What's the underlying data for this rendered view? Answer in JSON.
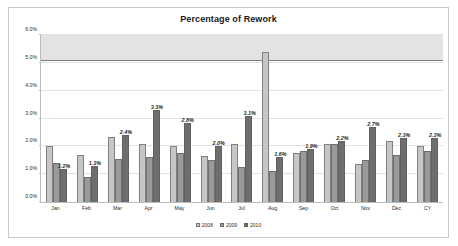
{
  "chart_data": {
    "type": "bar",
    "title": "Percentage of Rework",
    "xlabel": "",
    "ylabel": "",
    "ylim": [
      0,
      6
    ],
    "ytick_labels": [
      "0.0%",
      "1.0%",
      "2.0%",
      "3.0%",
      "4.0%",
      "5.0%",
      "6.0%"
    ],
    "ytick_values": [
      0,
      1,
      2,
      3,
      4,
      5,
      6
    ],
    "grid": true,
    "legend_position": "bottom",
    "categories": [
      "Jan",
      "Feb",
      "Mar",
      "Apr",
      "May",
      "Jun",
      "Jul",
      "Aug",
      "Sep",
      "Oct",
      "Nov",
      "Dec",
      "CY"
    ],
    "series": [
      {
        "name": "2008",
        "color": "#c6c6c6",
        "values": [
          2.0,
          1.7,
          2.35,
          2.1,
          2.0,
          1.65,
          2.1,
          5.4,
          1.75,
          2.1,
          1.35,
          2.2,
          2.0
        ]
      },
      {
        "name": "2009",
        "color": "#9a9a9a",
        "values": [
          1.4,
          0.9,
          1.55,
          1.6,
          1.75,
          1.5,
          1.25,
          1.1,
          1.85,
          2.1,
          1.5,
          1.7,
          1.85
        ]
      },
      {
        "name": "2010",
        "color": "#6e6e6e",
        "values": [
          1.2,
          1.3,
          2.4,
          3.3,
          2.85,
          2.0,
          3.1,
          1.6,
          1.9,
          2.2,
          2.7,
          2.3,
          2.3
        ]
      }
    ],
    "data_labels": [
      "1.2%",
      "1.3%",
      "2.4%",
      "3.3%",
      "2.8%",
      "2.0%",
      "3.1%",
      "1.6%",
      "1.9%",
      "2.2%",
      "2.7%",
      "2.3%",
      "2.3%"
    ],
    "annotations": {
      "band_label": "upper shaded band",
      "band_range": [
        5.1,
        6.0
      ],
      "band_color": "#d9d9d9",
      "threshold_value": 5.05,
      "threshold_color": "#7a7a7a"
    }
  },
  "legend": {
    "items": [
      {
        "label": "2008",
        "color": "#c6c6c6"
      },
      {
        "label": "2009",
        "color": "#9a9a9a"
      },
      {
        "label": "2010",
        "color": "#6e6e6e"
      }
    ]
  }
}
